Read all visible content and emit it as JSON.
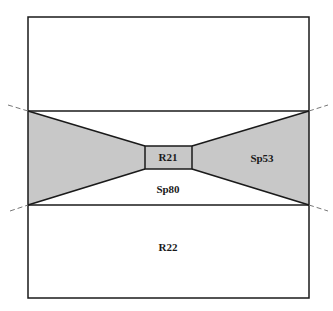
{
  "diagram": {
    "colors": {
      "line": "#1a1a1a",
      "fill": "#c8c8c8",
      "dashed": "#777777",
      "background": "#ffffff"
    },
    "regions": [
      {
        "id": "R21",
        "label": "R21",
        "x": 168,
        "y": 161
      },
      {
        "id": "Sp53",
        "label": "Sp53",
        "x": 262,
        "y": 162
      },
      {
        "id": "Sp80",
        "label": "Sp80",
        "x": 168,
        "y": 193
      },
      {
        "id": "R22",
        "label": "R22",
        "x": 168,
        "y": 251
      }
    ]
  }
}
